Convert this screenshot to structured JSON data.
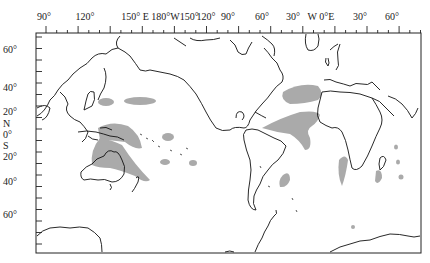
{
  "map": {
    "projection": "equirectangular, Pacific-centered",
    "frame": {
      "left": 36,
      "top": 33,
      "right": 421,
      "bottom": 253
    },
    "shading_color": "#aaaaaa",
    "coast_color": "#111111",
    "lon_labels": [
      {
        "text": "90°",
        "x": 44
      },
      {
        "text": "120°",
        "x": 85
      },
      {
        "text": "150° E 180°W150°",
        "x": 160
      },
      {
        "text": "120°",
        "x": 206
      },
      {
        "text": "90°",
        "x": 228
      },
      {
        "text": "60°",
        "x": 262
      },
      {
        "text": "30°",
        "x": 293
      },
      {
        "text": "W 0°E",
        "x": 321
      },
      {
        "text": "30°",
        "x": 360
      },
      {
        "text": "60°",
        "x": 392
      }
    ],
    "lat_labels": [
      {
        "text": "60°",
        "y": 50
      },
      {
        "text": "40°",
        "y": 88
      },
      {
        "text": "20°",
        "y": 112
      },
      {
        "text": "N",
        "y": 124
      },
      {
        "text": "0°",
        "y": 135
      },
      {
        "text": "S",
        "y": 146
      },
      {
        "text": "20°",
        "y": 157
      },
      {
        "text": "40°",
        "y": 182
      },
      {
        "text": "60°",
        "y": 215
      }
    ],
    "shaded_regions": [
      "NW Pacific near Japan (~30°N,140°E)",
      "Central North Pacific (~30°N,170°E-170°W)",
      "Tropical western Pacific / Maritime Continent",
      "SW Pacific band to New Zealand",
      "Central Pacific patches",
      "North Atlantic Gulf Stream region",
      "Tropical Atlantic band to Gulf of Guinea",
      "SW Atlantic off Brazil",
      "Mozambique channel / Madagascar",
      "Western Indian Ocean patches"
    ]
  }
}
